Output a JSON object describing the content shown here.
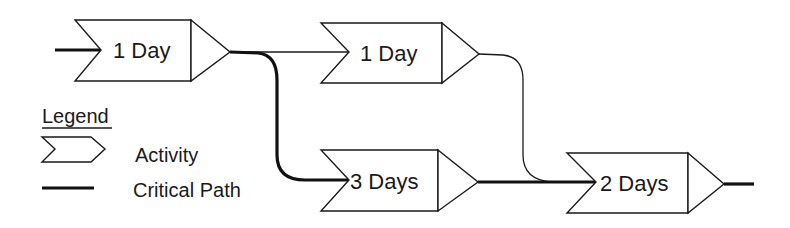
{
  "diagram": {
    "type": "critical-path-network",
    "activities": [
      {
        "id": "a1",
        "label": "1 Day",
        "critical": true
      },
      {
        "id": "a2",
        "label": "1 Day",
        "critical": false
      },
      {
        "id": "a3",
        "label": "3 Days",
        "critical": true
      },
      {
        "id": "a4",
        "label": "2 Days",
        "critical": true
      }
    ],
    "connections": [
      {
        "from": "start",
        "to": "a1",
        "critical": true
      },
      {
        "from": "a1",
        "to": "a2",
        "critical": false
      },
      {
        "from": "a1",
        "to": "a3",
        "critical": true
      },
      {
        "from": "a2",
        "to": "a4",
        "critical": false
      },
      {
        "from": "a3",
        "to": "a4",
        "critical": true
      },
      {
        "from": "a4",
        "to": "end",
        "critical": true
      }
    ]
  },
  "legend": {
    "title": "Legend",
    "items": [
      {
        "icon": "activity-chevron-icon",
        "label": "Activity"
      },
      {
        "icon": "thick-line-icon",
        "label": "Critical Path"
      }
    ]
  },
  "colors": {
    "stroke": "#1a1a1a",
    "background": "#ffffff"
  }
}
